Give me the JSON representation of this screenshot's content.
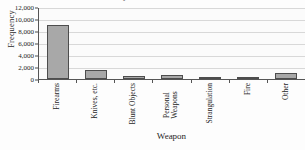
{
  "chart_data": {
    "type": "bar",
    "title": "Weapon Use in Homicides",
    "xlabel": "Weapon",
    "ylabel": "Frequency",
    "categories": [
      "Firearms",
      "Knives, etc.",
      "Blunt Objects",
      "Personal Weapons",
      "Strangulation",
      "Fire",
      "Other"
    ],
    "values": [
      9000,
      1500,
      500,
      750,
      300,
      200,
      1000
    ],
    "ylim": [
      0,
      12000
    ],
    "ytick_values": [
      0,
      2000,
      4000,
      6000,
      8000,
      10000,
      12000
    ],
    "ytick_labels": [
      "0",
      "2,000",
      "4,000",
      "6,000",
      "8,000",
      "10,000",
      "12,000"
    ],
    "grid": true,
    "legend": false,
    "bar_color": "#a8a8a8",
    "bar_border_color": "#4d4d4d",
    "gridline_color": "#d8d8d8",
    "axis_color": "#555555"
  }
}
